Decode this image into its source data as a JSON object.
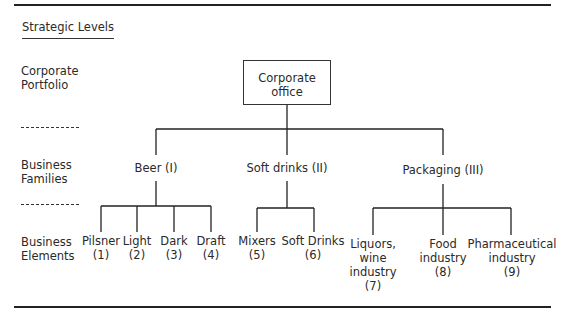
{
  "heading": "Strategic Levels",
  "levels": [
    {
      "label_line1": "Corporate",
      "label_line2": "Portfolio"
    },
    {
      "label_line1": "Business",
      "label_line2": "Families"
    },
    {
      "label_line1": "Business",
      "label_line2": "Elements"
    }
  ],
  "corporate": {
    "line1": "Corporate",
    "line2": "office"
  },
  "families": [
    {
      "label": "Beer (I)"
    },
    {
      "label": "Soft drinks (II)"
    },
    {
      "label": "Packaging (III)"
    }
  ],
  "elements": [
    {
      "line1": "Pilsner",
      "line2": "(1)"
    },
    {
      "line1": "Light",
      "line2": "(2)"
    },
    {
      "line1": "Dark",
      "line2": "(3)"
    },
    {
      "line1": "Draft",
      "line2": "(4)"
    },
    {
      "line1": "Mixers",
      "line2": "(5)"
    },
    {
      "line1": "Soft Drinks",
      "line2": "(6)"
    },
    {
      "line1": "Liquors,",
      "line2": "wine",
      "line3": "industry",
      "line4": "(7)"
    },
    {
      "line1": "Food",
      "line2": "industry",
      "line3": "(8)"
    },
    {
      "line1": "Pharmaceutical",
      "line2": "industry",
      "line3": "(9)"
    }
  ]
}
